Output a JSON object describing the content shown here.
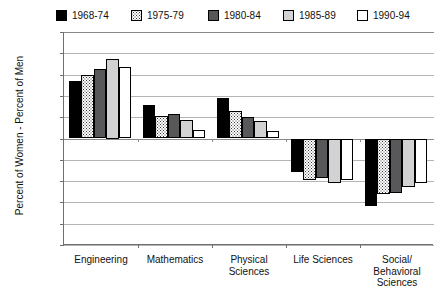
{
  "chart_data": {
    "type": "bar",
    "title": "",
    "xlabel": "",
    "ylabel": "Percent of Women - Percent of Men",
    "ylim": [
      -10,
      10
    ],
    "yticks": [
      10,
      8,
      6,
      4,
      2,
      0,
      -2,
      -4,
      -6,
      -8,
      -10
    ],
    "ytick_labels": [
      "10",
      "8",
      "6",
      "4",
      "2",
      "0",
      "-2",
      "-4",
      "-6",
      "-8",
      "-10"
    ],
    "grid": true,
    "legend_position": "top",
    "categories": [
      "Engineering",
      "Mathematics",
      "Physical\nSciences",
      "Life Sciences",
      "Social/\nBehavioral\nSciences"
    ],
    "series": [
      {
        "name": "1968-74",
        "color": "#000000",
        "values": [
          5.4,
          3.1,
          3.8,
          -3.1,
          -6.3
        ]
      },
      {
        "name": "1975-79",
        "color": "#ffffff",
        "values": [
          6.0,
          2.1,
          2.6,
          -3.9,
          -5.2
        ]
      },
      {
        "name": "1980-84",
        "color": "#58585a",
        "values": [
          6.5,
          2.3,
          2.0,
          -3.7,
          -5.1
        ]
      },
      {
        "name": "1985-89",
        "color": "#d2d2d2",
        "values": [
          7.5,
          1.7,
          1.6,
          -4.2,
          -4.6
        ]
      },
      {
        "name": "1990-94",
        "color": "#ffffff",
        "values": [
          6.7,
          0.8,
          0.7,
          -3.9,
          -4.2
        ]
      }
    ]
  },
  "legend": {
    "items": [
      {
        "label": "1968-74"
      },
      {
        "label": "1975-79"
      },
      {
        "label": "1980-84"
      },
      {
        "label": "1985-89"
      },
      {
        "label": "1990-94"
      }
    ]
  }
}
